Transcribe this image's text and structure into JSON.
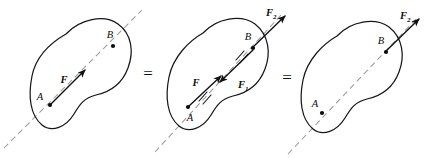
{
  "figure": {
    "equals_signs": [
      "=",
      "="
    ],
    "colors": {
      "body_outline": "#17171a",
      "line_of_action": "#9b9b9f",
      "vector": "#111114",
      "point": "#0c0c0e",
      "background": "#ffffff"
    }
  },
  "panels": [
    {
      "id": "panel-1",
      "points": [
        {
          "name": "A",
          "label": "A"
        },
        {
          "name": "B",
          "label": "B"
        }
      ],
      "vectors": [
        {
          "name": "F",
          "label": "F",
          "subscript": "",
          "at": "A",
          "direction": "up-right",
          "cancelled": false
        }
      ]
    },
    {
      "id": "panel-2",
      "points": [
        {
          "name": "A",
          "label": "A"
        },
        {
          "name": "B",
          "label": "B"
        }
      ],
      "vectors": [
        {
          "name": "F",
          "label": "F",
          "subscript": "",
          "at": "A",
          "direction": "up-right",
          "cancelled": true
        },
        {
          "name": "F1",
          "label": "F",
          "subscript": "1",
          "at": "B",
          "direction": "down-left",
          "cancelled": true
        },
        {
          "name": "F2",
          "label": "F",
          "subscript": "2",
          "at": "B",
          "direction": "up-right",
          "cancelled": false
        }
      ]
    },
    {
      "id": "panel-3",
      "points": [
        {
          "name": "A",
          "label": "A"
        },
        {
          "name": "B",
          "label": "B"
        }
      ],
      "vectors": [
        {
          "name": "F2",
          "label": "F",
          "subscript": "2",
          "at": "B",
          "direction": "up-right",
          "cancelled": false
        }
      ]
    }
  ]
}
